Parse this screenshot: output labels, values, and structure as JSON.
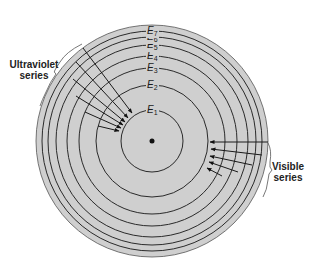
{
  "diagram": {
    "center": {
      "x": 152,
      "y": 141
    },
    "disk": {
      "radius": 116,
      "fill": "#cfcfcf",
      "stroke": "#555555"
    },
    "nucleus": {
      "radius": 2.5,
      "fill": "#111111"
    },
    "levels": [
      {
        "name": "E",
        "sub": "1",
        "radius": 31,
        "label_y": 108
      },
      {
        "name": "E",
        "sub": "2",
        "radius": 56,
        "label_y": 83
      },
      {
        "name": "E",
        "sub": "3",
        "radius": 73,
        "label_y": 66
      },
      {
        "name": "E",
        "sub": "4",
        "radius": 85,
        "label_y": 52
      },
      {
        "name": "E",
        "sub": "5",
        "radius": 96,
        "label_y": 38
      },
      {
        "name": "E",
        "sub": "6",
        "radius": 104,
        "label_y": 30
      },
      {
        "name": "E",
        "sub": "7",
        "radius": 110,
        "label_y": 21
      }
    ],
    "series": [
      {
        "name": "Ultraviolet series",
        "line1": "Ultraviolet",
        "line2": "series",
        "label_pos": {
          "x": 8,
          "y": 59
        },
        "arrows": [
          {
            "from": [
              83,
              48
            ],
            "to": [
              132,
              113
            ]
          },
          {
            "from": [
              76,
              62
            ],
            "to": [
              128,
              118
            ]
          },
          {
            "from": [
              73,
              79
            ],
            "to": [
              125,
              122
            ]
          },
          {
            "from": [
              76,
              96
            ],
            "to": [
              123,
              125
            ]
          },
          {
            "from": [
              85,
              112
            ],
            "to": [
              121,
              128
            ]
          },
          {
            "from": [
              98,
              126
            ],
            "to": [
              119,
              131
            ]
          }
        ]
      },
      {
        "name": "Visible series",
        "line1": "Visible",
        "line2": "series",
        "label_pos": {
          "x": 272,
          "y": 161
        },
        "arrows": [
          {
            "from": [
              268,
              142
            ],
            "to": [
              210,
              142
            ]
          },
          {
            "from": [
              262,
              155
            ],
            "to": [
              211,
              149
            ]
          },
          {
            "from": [
              252,
              165
            ],
            "to": [
              210,
              156
            ]
          },
          {
            "from": [
              238,
              172
            ],
            "to": [
              209,
              162
            ]
          },
          {
            "from": [
              222,
              176
            ],
            "to": [
              207,
              168
            ]
          }
        ]
      }
    ],
    "colors": {
      "line": "#2a2a2a",
      "arrow": "#1a1a1a",
      "text": "#222222"
    }
  }
}
